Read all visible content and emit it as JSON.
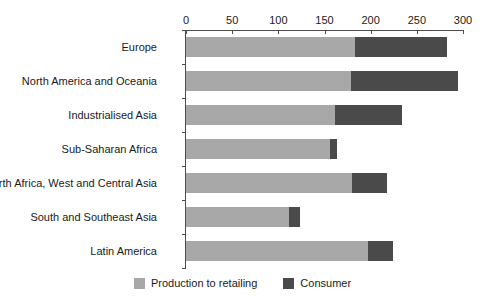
{
  "chart_data": {
    "type": "bar",
    "orientation": "horizontal",
    "stacked": true,
    "title": "",
    "xlabel": "",
    "ylabel": "",
    "xlim": [
      0,
      300
    ],
    "xticks": [
      0,
      50,
      100,
      150,
      200,
      250,
      300
    ],
    "grid": false,
    "legend_position": "bottom",
    "categories": [
      "Europe",
      "North America and Oceania",
      "Industrialised Asia",
      "Sub-Saharan Africa",
      "North Africa, West and Central Asia",
      "South and Southeast Asia",
      "Latin America"
    ],
    "series": [
      {
        "name": "Production to retailing",
        "color": "#a8a8a8",
        "values": [
          183,
          179,
          161,
          156,
          180,
          112,
          197
        ]
      },
      {
        "name": "Consumer",
        "color": "#4a4a4a",
        "values": [
          100,
          116,
          73,
          8,
          38,
          12,
          27
        ]
      }
    ],
    "totals": [
      283,
      295,
      234,
      164,
      218,
      124,
      224
    ]
  },
  "legend": {
    "items": [
      {
        "label": "Production to retailing",
        "color": "#a8a8a8"
      },
      {
        "label": "Consumer",
        "color": "#4a4a4a"
      }
    ]
  },
  "axis": {
    "tick_labels": [
      "0",
      "50",
      "100",
      "150",
      "200",
      "250",
      "300"
    ]
  }
}
